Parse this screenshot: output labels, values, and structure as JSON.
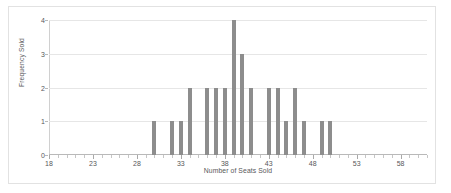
{
  "chart_data": {
    "type": "bar",
    "title": "",
    "xlabel": "Number of Seats Sold",
    "ylabel": "Frequency Sold",
    "xlim": [
      18,
      61
    ],
    "ylim": [
      0,
      4
    ],
    "grid": true,
    "legend": "none",
    "bar_color": "#8d8d8d",
    "xticks": [
      18,
      23,
      28,
      33,
      38,
      43,
      48,
      53,
      58
    ],
    "yticks": [
      0,
      1,
      2,
      3,
      4
    ],
    "categories": [
      30,
      32,
      33,
      34,
      36,
      37,
      38,
      39,
      40,
      41,
      43,
      44,
      45,
      46,
      47,
      49,
      50
    ],
    "values": [
      1,
      1,
      1,
      2,
      2,
      2,
      2,
      4,
      3,
      2,
      2,
      2,
      1,
      2,
      1,
      1,
      1
    ]
  }
}
